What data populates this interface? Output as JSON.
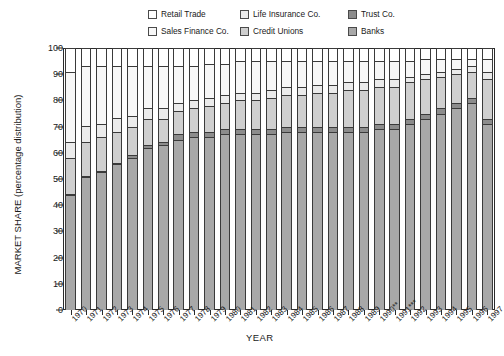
{
  "chart_data": {
    "type": "bar",
    "subtype": "stacked-100-percent",
    "title": "",
    "xlabel": "YEAR",
    "ylabel": "MARKET SHARE (percentage distribution)",
    "ylim": [
      0,
      100
    ],
    "yticks": [
      0,
      10,
      20,
      30,
      40,
      50,
      60,
      70,
      80,
      90,
      100
    ],
    "grid": false,
    "legend_position": "top",
    "categories": [
      "1970",
      "1971",
      "1972",
      "1973",
      "1974",
      "1975",
      "1976",
      "1977",
      "1978",
      "1979",
      "1980",
      "1981",
      "1982",
      "1983",
      "1984",
      "1985",
      "1986",
      "1987",
      "1988",
      "1989",
      "1990**",
      "1991***",
      "1992",
      "1993",
      "1994",
      "1995",
      "1996",
      "1997"
    ],
    "series": [
      {
        "name": "Banks",
        "color": "#a8a8a8",
        "values": [
          44,
          51,
          53,
          56,
          58,
          62,
          63,
          65,
          66,
          66,
          67,
          67,
          67,
          67,
          68,
          68,
          68,
          68,
          68,
          68,
          69,
          69,
          71,
          73,
          75,
          77,
          79,
          71
        ]
      },
      {
        "name": "Trust Co.",
        "color": "#8c8c8c",
        "values": [
          0,
          0,
          0,
          0,
          1,
          1,
          1,
          2,
          2,
          2,
          2,
          2,
          2,
          2,
          2,
          2,
          2,
          2,
          2,
          2,
          2,
          2,
          2,
          2,
          2,
          2,
          2,
          2
        ]
      },
      {
        "name": "Credit Unions",
        "color": "#cfcfcf",
        "values": [
          14,
          13,
          13,
          12,
          11,
          10,
          9,
          9,
          9,
          10,
          10,
          11,
          11,
          12,
          12,
          12,
          13,
          13,
          14,
          14,
          14,
          14,
          14,
          13,
          12,
          11,
          10,
          15
        ]
      },
      {
        "name": "Life Insurance Co.",
        "color": "#ebebeb",
        "values": [
          6,
          6,
          5,
          5,
          4,
          4,
          4,
          3,
          3,
          3,
          3,
          3,
          3,
          3,
          3,
          3,
          3,
          3,
          3,
          3,
          3,
          3,
          2,
          2,
          2,
          2,
          2,
          3
        ]
      },
      {
        "name": "Sales Finance Co.",
        "color": "#f7f7f7",
        "values": [
          27,
          23,
          22,
          20,
          19,
          16,
          16,
          14,
          13,
          13,
          12,
          12,
          12,
          11,
          10,
          10,
          9,
          9,
          8,
          8,
          7,
          7,
          6,
          6,
          5,
          4,
          3,
          5
        ]
      },
      {
        "name": "Retail Trade",
        "color": "#ffffff",
        "values": [
          9,
          7,
          7,
          7,
          7,
          7,
          7,
          7,
          7,
          6,
          6,
          5,
          5,
          5,
          5,
          5,
          5,
          5,
          5,
          5,
          5,
          5,
          5,
          4,
          4,
          4,
          4,
          4
        ]
      }
    ]
  },
  "legend": {
    "entries": [
      {
        "label": "Retail Trade",
        "color": "#ffffff"
      },
      {
        "label": "Life Insurance Co.",
        "color": "#ebebeb"
      },
      {
        "label": "Trust Co.",
        "color": "#8c8c8c"
      },
      {
        "label": "Sales Finance Co.",
        "color": "#f7f7f7"
      },
      {
        "label": "Credit Unions",
        "color": "#cfcfcf"
      },
      {
        "label": "Banks",
        "color": "#a8a8a8"
      }
    ]
  },
  "axes": {
    "y_title": "MARKET SHARE (percentage distribution)",
    "x_title": "YEAR",
    "y_tick_labels": [
      "0",
      "10",
      "20",
      "30",
      "40",
      "50",
      "60",
      "70",
      "80",
      "90",
      "100"
    ]
  }
}
